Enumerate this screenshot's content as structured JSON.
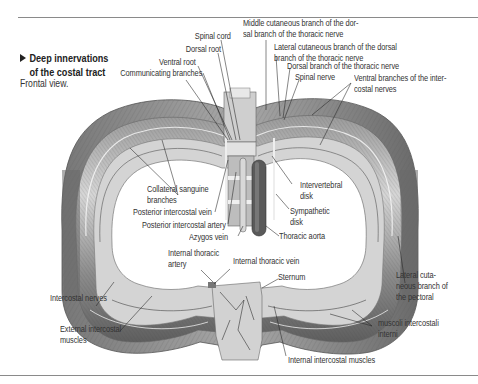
{
  "figure": {
    "title_line1": "Deep innervations",
    "title_line2": "of the costal tract",
    "subtitle": "Frontal view.",
    "colors": {
      "rule": "#8a8a8a",
      "text": "#333333",
      "ink": "#222222",
      "tissue_light": "#e6e6e6",
      "tissue_mid": "#bdbdbd",
      "tissue_dark": "#6e6e6e"
    }
  },
  "labels": {
    "spinal_cord": "Spinal cord",
    "dorsal_root": "Dorsal root",
    "ventral_root": "Ventral root",
    "communicating_branches": "Communicating branches",
    "middle_cutaneous_1": "Middle cutaneous branch of the dor-",
    "middle_cutaneous_2": "sal branch of the thoracic nerve",
    "lateral_cutaneous_dorsal_1": "Lateral cutaneous branch of the dorsal",
    "lateral_cutaneous_dorsal_2": "branch of the thoracic nerve",
    "dorsal_branch": "Dorsal branch of the thoracic nerve",
    "spinal_nerve": "Spinal nerve",
    "ventral_branches_1": "Ventral branches of the inter-",
    "ventral_branches_2": "costal nerves",
    "collateral_1": "Collateral sanguine",
    "collateral_2": "branches",
    "post_ic_vein": "Posterior intercostal vein",
    "post_ic_artery": "Posterior intercostal artery",
    "azygos": "Azygos vein",
    "intervertebral_1": "Intervertebral",
    "intervertebral_2": "disk",
    "sympathetic_1": "Sympathetic",
    "sympathetic_2": "disk",
    "thoracic_aorta": "Thoracic aorta",
    "int_thoracic_artery_1": "Internal thoracic",
    "int_thoracic_artery_2": "artery",
    "int_thoracic_vein": "Internal thoracic vein",
    "sternum": "Sternum",
    "intercostal_nerves": "Intercostal nerves",
    "ext_ic_muscles_1": "External intercostal",
    "ext_ic_muscles_2": "muscles",
    "lateral_pectoral_1": "Lateral cuta-",
    "lateral_pectoral_2": "neous branch of",
    "lateral_pectoral_3": "the pectoral",
    "muscoli_1": "muscoli intercostali",
    "muscoli_2": "interni",
    "int_ic_muscles": "Internal intercostal muscles"
  }
}
